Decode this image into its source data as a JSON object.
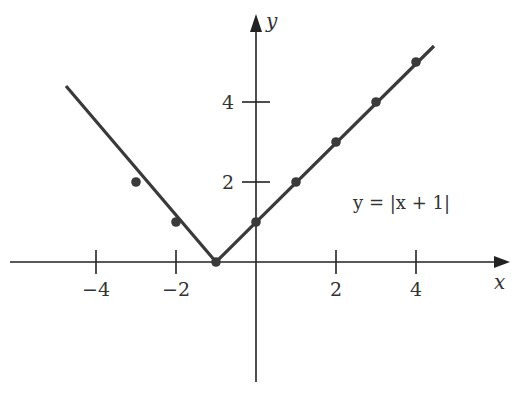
{
  "chart_data": {
    "type": "line",
    "title": "",
    "equation_label": "y = |x + 1|",
    "xlabel": "x",
    "ylabel": "y",
    "x_ticks": [
      -4,
      -2,
      2,
      4
    ],
    "x_tick_labels": [
      "−4",
      "−2",
      "2",
      "4"
    ],
    "y_ticks": [
      2,
      4
    ],
    "y_tick_labels": [
      "2",
      "4"
    ],
    "xlim": [
      -6.2,
      6.2
    ],
    "ylim": [
      -3,
      5.8
    ],
    "grid": false,
    "line_endpoints": [
      [
        -4.75,
        4.4
      ],
      [
        4.45,
        5.4
      ]
    ],
    "series": [
      {
        "name": "y = |x + 1|",
        "points": [
          [
            -3,
            2
          ],
          [
            -2,
            1
          ],
          [
            -1,
            0
          ],
          [
            0,
            1
          ],
          [
            1,
            2
          ],
          [
            2,
            3
          ],
          [
            3,
            4
          ],
          [
            4,
            5
          ]
        ]
      }
    ],
    "colors": {
      "line": "#3a3a3a",
      "axis": "#222222",
      "text": "#333333"
    }
  }
}
